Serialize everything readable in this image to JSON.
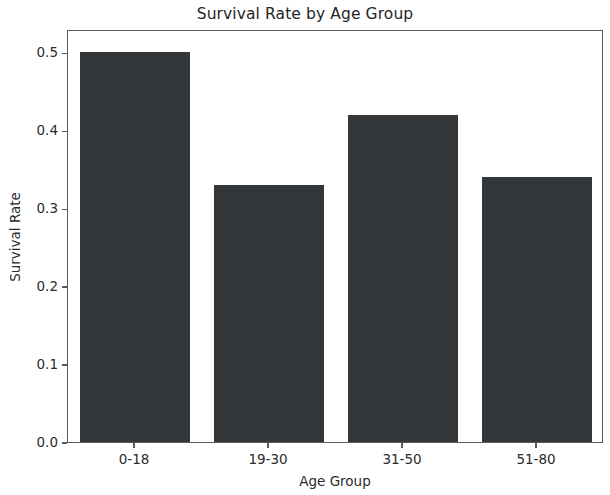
{
  "chart_data": {
    "type": "bar",
    "title": "Survival Rate by Age Group",
    "xlabel": "Age Group",
    "ylabel": "Survival Rate",
    "categories": [
      "0-18",
      "19-30",
      "31-50",
      "51-80"
    ],
    "values": [
      0.5,
      0.33,
      0.42,
      0.34
    ],
    "ylim": [
      0.0,
      0.53
    ],
    "yticks": [
      "0.0",
      "0.1",
      "0.2",
      "0.3",
      "0.4",
      "0.5"
    ],
    "ytick_values": [
      0.0,
      0.1,
      0.2,
      0.3,
      0.4,
      0.5
    ],
    "grid": false,
    "legend": false,
    "bar_color": "#343739",
    "background_color": "#ffffff",
    "axis_color": "#5a5a5a"
  }
}
